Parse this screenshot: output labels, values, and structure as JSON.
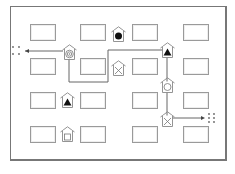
{
  "diagram": {
    "type": "floor-plan-route",
    "colors": {
      "frame": "#777777",
      "box": "#9a9a9a",
      "path": "#666666",
      "house": "#888888",
      "fill": "#111111"
    },
    "boxes": [
      {
        "x": 30,
        "y": 24
      },
      {
        "x": 80,
        "y": 24
      },
      {
        "x": 132,
        "y": 24
      },
      {
        "x": 183,
        "y": 24
      },
      {
        "x": 30,
        "y": 58
      },
      {
        "x": 80,
        "y": 58
      },
      {
        "x": 132,
        "y": 58
      },
      {
        "x": 183,
        "y": 58
      },
      {
        "x": 30,
        "y": 92
      },
      {
        "x": 80,
        "y": 92
      },
      {
        "x": 132,
        "y": 92
      },
      {
        "x": 183,
        "y": 92
      },
      {
        "x": 30,
        "y": 126
      },
      {
        "x": 80,
        "y": 126
      },
      {
        "x": 132,
        "y": 126
      },
      {
        "x": 183,
        "y": 126
      }
    ],
    "houses": [
      {
        "name": "house-target",
        "symbol": "target-icon",
        "x": 62,
        "y": 44
      },
      {
        "name": "house-filled-circle",
        "symbol": "filled-circle-icon",
        "x": 111,
        "y": 26
      },
      {
        "name": "house-x",
        "symbol": "x-mark-icon",
        "x": 111,
        "y": 60
      },
      {
        "name": "house-triangle-right",
        "symbol": "triangle-icon",
        "x": 160,
        "y": 42
      },
      {
        "name": "house-circle-line",
        "symbol": "circle-line-icon",
        "x": 160,
        "y": 77
      },
      {
        "name": "house-x-right",
        "symbol": "x-mark-icon",
        "x": 160,
        "y": 111
      },
      {
        "name": "house-triangle-left",
        "symbol": "triangle-icon",
        "x": 60,
        "y": 92
      },
      {
        "name": "house-square",
        "symbol": "square-icon",
        "x": 60,
        "y": 126
      }
    ],
    "start_marker": {
      "x": 14,
      "y": 51
    },
    "end_marker": {
      "x": 205,
      "y": 118
    }
  }
}
